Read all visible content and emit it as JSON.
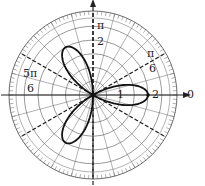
{
  "chart_data": {
    "type": "line",
    "subtype": "polar",
    "title": "",
    "equation": "r = 2cos(3θ)",
    "series": [
      {
        "name": "three-leaf rose",
        "theta_deg": [
          0,
          10,
          20,
          30,
          40,
          50,
          60,
          70,
          80,
          90,
          100,
          110,
          120,
          130,
          140,
          150,
          160,
          170,
          180
        ],
        "r": [
          2,
          1.73,
          1,
          0,
          -1,
          -1.73,
          -2,
          -1.73,
          -1,
          0,
          1,
          1.73,
          2,
          1.73,
          1,
          0,
          -1,
          -1.73,
          -2
        ]
      }
    ],
    "radial_ticks": [
      1,
      2
    ],
    "angle_labels": [
      "0",
      "π/6",
      "π/2",
      "5π/6"
    ],
    "radial_lines_step_deg": 15,
    "highlighted_lines_deg": [
      30,
      90,
      150
    ],
    "rlim": [
      0,
      3
    ]
  },
  "labels": {
    "zero": "0",
    "pi6_num": "π",
    "pi6_den": "6",
    "pi2_num": "π",
    "pi2_den": "2",
    "fivepi6_num": "5π",
    "fivepi6_den": "6",
    "r1": "1",
    "r2": "2"
  }
}
